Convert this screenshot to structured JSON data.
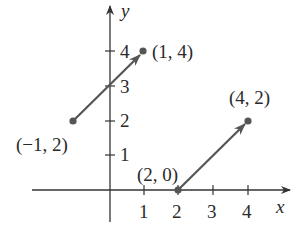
{
  "diagram": {
    "type": "coordinate-plane-vectors",
    "axes": {
      "x_label": "x",
      "y_label": "y",
      "x_ticks": [
        "1",
        "2",
        "3",
        "4"
      ],
      "y_ticks": [
        "1",
        "2",
        "3",
        "4"
      ]
    },
    "vectors": [
      {
        "tail": "(−1, 2)",
        "head": "(1, 4)"
      },
      {
        "tail": "(2, 0)",
        "head": "(4, 2)"
      }
    ],
    "colors": {
      "vector": "#555555",
      "axis": "#333333",
      "text": "#2a2a2a"
    }
  }
}
